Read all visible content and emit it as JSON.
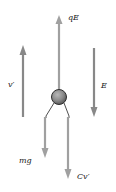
{
  "diagram": {
    "labels": {
      "qE": "qE",
      "v_prime": "v′",
      "E": "E",
      "mg": "mg",
      "Cv_prime": "Cv′"
    },
    "colors": {
      "arrow_gray": "#9a9a9a",
      "arrow_dark": "#7a7a7a",
      "drop_fill": "#8c8c8c",
      "drop_outline": "#333333",
      "text": "#1a1a1a"
    },
    "elements": [
      {
        "id": "qE",
        "type": "force-arrow",
        "direction": "up",
        "label": "qE"
      },
      {
        "id": "v_prime",
        "type": "velocity-arrow",
        "direction": "up",
        "label": "v′"
      },
      {
        "id": "E",
        "type": "field-arrow",
        "direction": "down",
        "label": "E"
      },
      {
        "id": "mg",
        "type": "force-arrow",
        "direction": "down",
        "label": "mg"
      },
      {
        "id": "Cv_prime",
        "type": "force-arrow",
        "direction": "down",
        "label": "Cv′"
      },
      {
        "id": "drop",
        "type": "sphere",
        "label": ""
      }
    ]
  }
}
